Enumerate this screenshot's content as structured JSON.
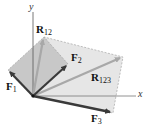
{
  "diagram": {
    "axes": {
      "x_label": "x",
      "y_label": "y"
    },
    "vectors": [
      {
        "name": "F",
        "sub": "1"
      },
      {
        "name": "F",
        "sub": "2"
      },
      {
        "name": "F",
        "sub": "3"
      },
      {
        "name": "R",
        "sub": "12"
      },
      {
        "name": "R",
        "sub": "123"
      }
    ],
    "colors": {
      "force_arrow": "#3a3a3a",
      "resultant_arrow": "#a8a8a8",
      "parallelogram_fill_1": "#c9c9c9",
      "parallelogram_fill_2": "#e4e4e4",
      "axis": "#555555"
    }
  }
}
